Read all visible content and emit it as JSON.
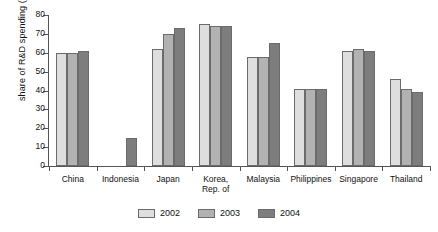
{
  "chart_data": {
    "type": "bar",
    "title": "",
    "xlabel": "",
    "ylabel": "share of R&D spending (%)",
    "ylim": [
      0,
      80
    ],
    "yticks": [
      0,
      10,
      20,
      30,
      40,
      50,
      60,
      70,
      80
    ],
    "ytick_labels": [
      "0",
      "10",
      "20",
      "30",
      "40",
      "50",
      "60",
      "70",
      "80"
    ],
    "grid": false,
    "legend_position": "bottom-center",
    "categories": [
      "China",
      "Indonesia",
      "Japan",
      "Korea, Rep. of",
      "Malaysia",
      "Philippines",
      "Singapore",
      "Thailand"
    ],
    "category_lines": [
      [
        "China",
        ""
      ],
      [
        "Indonesia",
        ""
      ],
      [
        "Japan",
        ""
      ],
      [
        "Korea,",
        "Rep. of"
      ],
      [
        "Malaysia",
        ""
      ],
      [
        "Philippines",
        ""
      ],
      [
        "Singapore",
        ""
      ],
      [
        "Thailand",
        ""
      ]
    ],
    "series": [
      {
        "name": "2002",
        "color": "#dedede",
        "values": [
          60,
          null,
          62,
          75,
          58,
          41,
          61,
          46
        ]
      },
      {
        "name": "2003",
        "color": "#b2b2b2",
        "values": [
          60,
          null,
          70,
          74,
          58,
          41,
          62,
          41
        ]
      },
      {
        "name": "2004",
        "color": "#7d7d7d",
        "values": [
          61,
          15,
          73,
          74,
          65,
          41,
          61,
          39
        ]
      }
    ],
    "legend": [
      {
        "label": "2002",
        "color": "#dedede"
      },
      {
        "label": "2003",
        "color": "#b2b2b2"
      },
      {
        "label": "2004",
        "color": "#7d7d7d"
      }
    ]
  }
}
